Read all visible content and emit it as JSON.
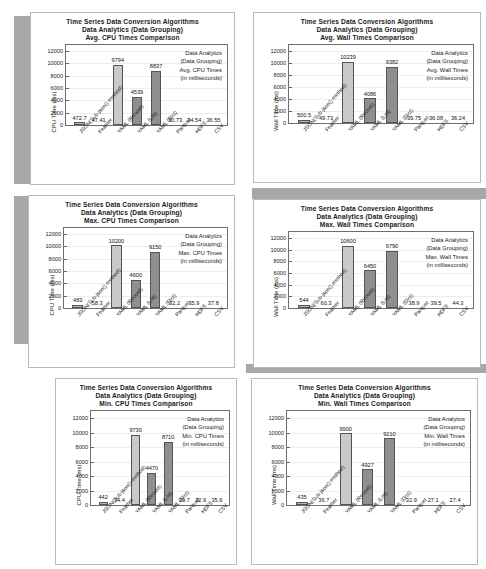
{
  "document": {
    "kind": "scanned-figure-sheet",
    "page_background": "#ffffff",
    "scan_artifact_color": "#a8a8a8"
  },
  "common": {
    "title_line1": "Time Series Data Conversion Algorithms",
    "title_line2": "Data Analytics (Data Grouping)",
    "categories": [
      "JSON(Sub-json() method)",
      "Feather",
      "YAML (Record)",
      "YAML (List)",
      "YAML (Dict)",
      "Parquet",
      "HDF5",
      "CSV"
    ],
    "yticks": [
      "0",
      "2000",
      "4000",
      "6000",
      "8000",
      "10000",
      "12000"
    ],
    "ylim": [
      0,
      13000
    ],
    "bar_colors": {
      "light": "#c9c9c9",
      "dark": "#8f8f8f",
      "tiny": "#b5b5b5"
    }
  },
  "chart_data": [
    {
      "id": "avg-cpu",
      "type": "bar",
      "title": "Time Series Data Conversion Algorithms\nData Analytics (Data Grouping)\nAvg. CPU Times Comparison",
      "title_line3": "Avg. CPU Times Comparison",
      "xlabel": "",
      "ylabel": "CPU Time (ms)",
      "ylim": [
        0,
        13000
      ],
      "yticks": [
        0,
        2000,
        4000,
        6000,
        8000,
        10000,
        12000
      ],
      "grid": false,
      "legend_position": "top-right",
      "legend": [
        "Data Analytics",
        "(Data Grouping)",
        "Avg. CPU Times",
        "(in milliseconds)"
      ],
      "categories": [
        "JSON(Sub-json() method)",
        "Feather",
        "YAML (Record)",
        "YAML (List)",
        "YAML (Dict)",
        "Parquet",
        "HDF5",
        "CSV"
      ],
      "values": [
        472.7,
        47.41,
        9794,
        4539,
        8837,
        30.73,
        34.54,
        36.55
      ],
      "labels": [
        "472.7",
        "47.41",
        "9794",
        "4539",
        "8837",
        "30.73",
        "34.54",
        "36.55"
      ],
      "shades": [
        "tiny",
        "none",
        "light",
        "dark",
        "dark",
        "none",
        "none",
        "none"
      ]
    },
    {
      "id": "avg-wall",
      "type": "bar",
      "title": "Time Series Data Conversion Algorithms\nData Analytics (Data Grouping)\nAvg. Wall Times Comparison",
      "title_line3": "Avg. Wall Times Comparison",
      "xlabel": "",
      "ylabel": "Wall Time (ms)",
      "ylim": [
        0,
        13000
      ],
      "yticks": [
        0,
        2000,
        4000,
        6000,
        8000,
        10000,
        12000
      ],
      "grid": false,
      "legend_position": "top-right",
      "legend": [
        "Data Analytics",
        "(Data Grouping)",
        "Avg. Wall Times",
        "(in milliseconds)"
      ],
      "categories": [
        "JSON(Sub-json() method)",
        "Feather",
        "YAML (Record)",
        "YAML (List)",
        "YAML (Dict)",
        "Parquet",
        "HDF5",
        "CSV"
      ],
      "values": [
        500.5,
        49.73,
        10239,
        4086,
        9382,
        39.75,
        36.08,
        36.24
      ],
      "labels": [
        "500.5",
        "49.73",
        "10239",
        "4086",
        "9382",
        "39.75",
        "36.08",
        "36.24"
      ],
      "shades": [
        "tiny",
        "none",
        "light",
        "dark",
        "dark",
        "none",
        "none",
        "none"
      ]
    },
    {
      "id": "max-cpu",
      "type": "bar",
      "title": "Time Series Data Conversion Algorithms\nData Analytics (Data Grouping)\nMax. CPU Times Comparison",
      "title_line3": "Max. CPU Times Comparison",
      "xlabel": "",
      "ylabel": "CPU Time (ms)",
      "ylim": [
        0,
        13000
      ],
      "yticks": [
        0,
        2000,
        4000,
        6000,
        8000,
        10000,
        12000
      ],
      "grid": false,
      "legend_position": "top-right",
      "legend": [
        "Data Analytics",
        "(Data Grouping)",
        "Max. CPU Times",
        "(in milliseconds)"
      ],
      "categories": [
        "JSON(Sub-json() method)",
        "Feather",
        "YAML (Record)",
        "YAML (List)",
        "YAML (Dict)",
        "Parquet",
        "HDF5",
        "CSV"
      ],
      "values": [
        483,
        58.3,
        10200,
        4600,
        9150,
        32.2,
        35.9,
        37.8
      ],
      "labels": [
        "483",
        "58.3",
        "10200",
        "4600",
        "9150",
        "32.2",
        "35.9",
        "37.8"
      ],
      "shades": [
        "tiny",
        "none",
        "light",
        "dark",
        "dark",
        "none",
        "none",
        "none"
      ]
    },
    {
      "id": "max-wall",
      "type": "bar",
      "title": "Time Series Data Conversion Algorithms\nData Analytics (Data Grouping)\nMax. Wall Times Comparison",
      "title_line3": "Max. Wall Times Comparison",
      "xlabel": "",
      "ylabel": "Wall Time (ms)",
      "ylim": [
        0,
        13000
      ],
      "yticks": [
        0,
        2000,
        4000,
        6000,
        8000,
        10000,
        12000
      ],
      "grid": false,
      "legend_position": "top-right",
      "legend": [
        "Data Analytics",
        "(Data Grouping)",
        "Max. Wall Times",
        "(in milliseconds)"
      ],
      "categories": [
        "JSON(Sub-json() method)",
        "Feather",
        "YAML (Record)",
        "YAML (List)",
        "YAML (Dict)",
        "Parquet",
        "HDF5",
        "CSV"
      ],
      "values": [
        544,
        60.3,
        10600,
        6450,
        9790,
        38.9,
        39.5,
        44.3
      ],
      "labels": [
        "544",
        "60.3",
        "10600",
        "6450",
        "9790",
        "38.9",
        "39.5",
        "44.3"
      ],
      "shades": [
        "tiny",
        "none",
        "light",
        "dark",
        "dark",
        "none",
        "none",
        "none"
      ]
    },
    {
      "id": "min-cpu",
      "type": "bar",
      "title": "Time Series Data Conversion Algorithms\nData Analytics (Data Grouping)\nMin. CPU Times Comparison",
      "title_line3": "Min. CPU Times Comparison",
      "xlabel": "",
      "ylabel": "CPU Time (ms)",
      "ylim": [
        0,
        13000
      ],
      "yticks": [
        0,
        2000,
        4000,
        6000,
        8000,
        10000,
        12000
      ],
      "grid": false,
      "legend_position": "top-right",
      "legend": [
        "Data Analytics",
        "(Data Grouping)",
        "Min. CPU Times",
        "(in milliseconds)"
      ],
      "categories": [
        "JSON(Sub-json() method)",
        "Feather",
        "YAML (Record)",
        "YAML (List)",
        "YAML (Dict)",
        "Parquet",
        "HDF5",
        "CSV"
      ],
      "values": [
        442,
        34.4,
        9730,
        4470,
        8710,
        29.7,
        32.9,
        35.6
      ],
      "labels": [
        "442",
        "34.4",
        "9730",
        "4470",
        "8710",
        "29.7",
        "32.9",
        "35.6"
      ],
      "shades": [
        "tiny",
        "none",
        "light",
        "dark",
        "dark",
        "none",
        "none",
        "none"
      ]
    },
    {
      "id": "min-wall",
      "type": "bar",
      "title": "Time Series Data Conversion Algorithms\nData Analytics (Data Grouping)\nMin. Wall Times Comparison",
      "title_line3": "Min. Wall Times Comparison",
      "xlabel": "",
      "ylabel": "Wall Time (ms)",
      "ylim": [
        0,
        13000
      ],
      "yticks": [
        0,
        2000,
        4000,
        6000,
        8000,
        10000,
        12000
      ],
      "grid": false,
      "legend_position": "top-right",
      "legend": [
        "Data Analytics",
        "(Data Grouping)",
        "Min. Wall Times",
        "(in milliseconds)"
      ],
      "categories": [
        "JSON(Sub-json() method)",
        "Feather",
        "YAML (Record)",
        "YAML (List)",
        "YAML (Dict)",
        "Parquet",
        "HDF5",
        "CSV"
      ],
      "values": [
        435,
        36.7,
        9900,
        4927,
        9210,
        32.9,
        27.1,
        27.4
      ],
      "labels": [
        "435",
        "36.7",
        "9900",
        "4927",
        "9210",
        "32.9",
        "27.1",
        "27.4"
      ],
      "shades": [
        "tiny",
        "none",
        "light",
        "dark",
        "dark",
        "none",
        "none",
        "none"
      ]
    }
  ]
}
